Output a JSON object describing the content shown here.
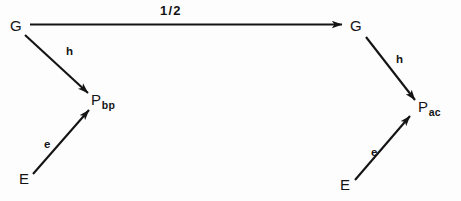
{
  "figure": {
    "kind": "commutative-diagram",
    "background_color": "#fdfdfd",
    "ink_color": "#141414",
    "width": 461,
    "height": 201
  },
  "nodes": {
    "left_g": {
      "label": "G",
      "subscript": ""
    },
    "left_p": {
      "label": "P",
      "subscript": "bp"
    },
    "left_e": {
      "label": "E",
      "subscript": ""
    },
    "right_g": {
      "label": "G",
      "subscript": ""
    },
    "right_p": {
      "label": "P",
      "subscript": "ac"
    },
    "right_e": {
      "label": "E",
      "subscript": ""
    }
  },
  "edges": {
    "g_to_g": {
      "label": "1/2",
      "from": "left_g",
      "to": "right_g"
    },
    "left_h": {
      "label": "h",
      "from": "left_g",
      "to": "left_p"
    },
    "left_e_edge": {
      "label": "e",
      "from": "left_e",
      "to": "left_p"
    },
    "right_h": {
      "label": "h",
      "from": "right_g",
      "to": "right_p"
    },
    "right_e_edge": {
      "label": "e",
      "from": "right_e",
      "to": "right_p"
    }
  }
}
